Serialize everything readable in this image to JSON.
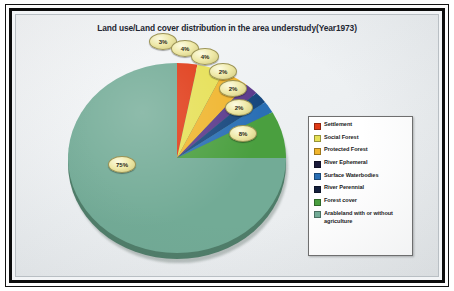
{
  "chart_data": {
    "type": "pie",
    "title": "Land use/Land cover distribution in the area understudy(Year1973)",
    "legend_position": "right",
    "categories": [
      "Settlement",
      "Social Forest",
      "Protected Forest",
      "River Ephemeral",
      "Surface Waterbodies",
      "River Perennial",
      "Forest cover",
      "Arableland with or without agriculture"
    ],
    "values": [
      3,
      4,
      4,
      2,
      2,
      2,
      8,
      75
    ],
    "value_labels": [
      "3%",
      "4%",
      "4%",
      "2%",
      "2%",
      "2%",
      "8%",
      "75%"
    ],
    "colors": [
      "#e03a16",
      "#e6e055",
      "#f0b52d",
      "#5b3a8c",
      "#17477e",
      "#2a6fb5",
      "#4a9f3f",
      "#72ab96"
    ],
    "units": "percent",
    "total": 100
  },
  "title": {
    "text": "Land use/Land cover distribution in the area understudy(Year1973)"
  },
  "legend": {
    "items": [
      {
        "label": "Settlement",
        "color": "#e03a16"
      },
      {
        "label": "Social Forest",
        "color": "#e6e055"
      },
      {
        "label": "Protected Forest",
        "color": "#f0b52d"
      },
      {
        "label": "River Ephemeral",
        "color": "#1b1b3a"
      },
      {
        "label": "Surface Waterbodies",
        "color": "#2a6fb5"
      },
      {
        "label": "River Perennial",
        "color": "#14203c"
      },
      {
        "label": "Forest cover",
        "color": "#4a9f3f"
      },
      {
        "label": "Arableland with or without agriculture",
        "color": "#72ab96"
      }
    ]
  },
  "callouts": [
    {
      "value": "3%",
      "x": 133,
      "y": 18
    },
    {
      "value": "4%",
      "x": 155,
      "y": 25
    },
    {
      "value": "4%",
      "x": 175,
      "y": 33
    },
    {
      "value": "2%",
      "x": 193,
      "y": 48
    },
    {
      "value": "2%",
      "x": 203,
      "y": 65
    },
    {
      "value": "2%",
      "x": 209,
      "y": 84
    },
    {
      "value": "8%",
      "x": 213,
      "y": 110
    },
    {
      "value": "75%",
      "x": 92,
      "y": 141
    }
  ]
}
